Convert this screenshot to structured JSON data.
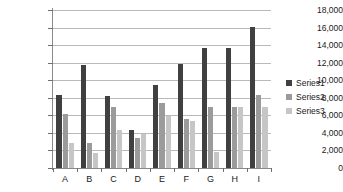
{
  "chart_data": {
    "type": "bar",
    "title": "",
    "xlabel": "",
    "ylabel": "",
    "ylim": [
      0,
      18000
    ],
    "ytick_values": [
      0,
      2000,
      4000,
      6000,
      8000,
      10000,
      12000,
      14000,
      16000,
      18000
    ],
    "ytick_labels": [
      "0",
      "2,000",
      "4,000",
      "6,000",
      "8,000",
      "10,000",
      "12,000",
      "14,000",
      "16,000",
      "18,000"
    ],
    "categories": [
      "A",
      "B",
      "C",
      "D",
      "E",
      "F",
      "G",
      "H",
      "I"
    ],
    "grid": true,
    "legend_position": "right",
    "series": [
      {
        "name": "Series1",
        "color": "#404040",
        "values": [
          8300,
          11700,
          8200,
          4300,
          9500,
          11800,
          13700,
          13700,
          16100
        ]
      },
      {
        "name": "Series2",
        "color": "#9b9b9b",
        "values": [
          6100,
          2800,
          6900,
          3400,
          7400,
          5600,
          6900,
          6900,
          8300
        ]
      },
      {
        "name": "Series3",
        "color": "#c6c6c6",
        "values": [
          2900,
          1700,
          4300,
          3900,
          5900,
          5400,
          1800,
          6900,
          7000
        ]
      }
    ]
  }
}
